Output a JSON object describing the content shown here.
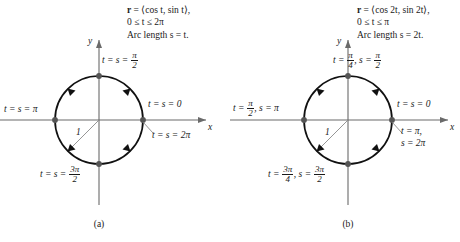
{
  "figure": {
    "type": "math-diagram",
    "panels": [
      {
        "id": "a",
        "caption": "(a)",
        "equation": {
          "line1_vector": "r",
          "line1_rest": " = ⟨cos t, sin t⟩,",
          "line2": "0 ≤ t ≤ 2π",
          "line3": "Arc length s = t."
        },
        "axes": {
          "x_label": "x",
          "y_label": "y"
        },
        "radius_label": "1",
        "circle": {
          "cx": 99,
          "cy": 120,
          "r": 44
        },
        "points": [
          {
            "name": "point-right-0",
            "angle_deg": 0,
            "label_html": "t = s = 0",
            "label_x": 148,
            "label_y": 104
          },
          {
            "name": "point-top",
            "angle_deg": 90,
            "label_html": "t = s = π/2",
            "label_x": 102,
            "label_y": 56
          },
          {
            "name": "point-left",
            "angle_deg": 180,
            "label_html": "t = s = π",
            "label_x": 4,
            "label_y": 108
          },
          {
            "name": "point-bottom",
            "angle_deg": 270,
            "label_html": "t = s = 3π/2",
            "label_x": 40,
            "label_y": 170
          },
          {
            "name": "point-right-2pi",
            "angle_deg": 0,
            "label_html": "t = s = 2π",
            "label_x": 148,
            "label_y": 134
          }
        ]
      },
      {
        "id": "b",
        "caption": "(b)",
        "equation": {
          "line1_vector": "r",
          "line1_rest": " = ⟨cos 2t, sin 2t⟩,",
          "line2": "0 ≤ t ≤ π",
          "line3": "Arc length s = 2t."
        },
        "axes": {
          "x_label": "x",
          "y_label": "y"
        },
        "radius_label": "1",
        "circle": {
          "cx": 348,
          "cy": 120,
          "r": 44
        },
        "points": [
          {
            "name": "point-right-0",
            "angle_deg": 0,
            "label_html": "t = s = 0",
            "label_x": 397,
            "label_y": 104
          },
          {
            "name": "point-top",
            "angle_deg": 90,
            "label_html": "t = π/4, s = π/2",
            "label_x": 333,
            "label_y": 56
          },
          {
            "name": "point-left",
            "angle_deg": 180,
            "label_html": "t = π/2, s = π",
            "label_x": 233,
            "label_y": 104
          },
          {
            "name": "point-bottom",
            "angle_deg": 270,
            "label_html": "t = 3π/4, s = 3π/2",
            "label_x": 268,
            "label_y": 170
          },
          {
            "name": "point-right-2pi",
            "angle_deg": 0,
            "label_html": "t = π, s = 2π",
            "label_x": 397,
            "label_y": 130
          }
        ]
      }
    ],
    "colors": {
      "ink": "#1a1a1a",
      "axis": "#6a6a6a",
      "curve": "#111111",
      "node": "#555555",
      "leader": "#7a7a7a",
      "background": "#ffffff"
    },
    "symbols": {
      "pi": "π",
      "leq": "≤",
      "langle": "⟨",
      "rangle": "⟩"
    }
  }
}
